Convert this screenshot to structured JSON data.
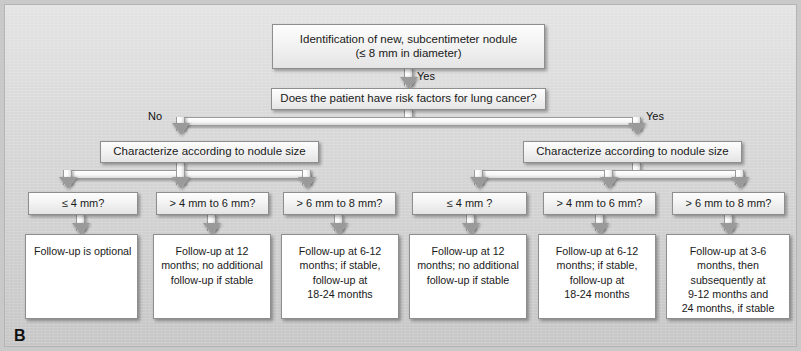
{
  "figure": {
    "panel_label": "B",
    "background_color": "#d5d5d5",
    "box_border_color": "#8e8e8e",
    "leaf_fill_color": "#ffffff"
  },
  "nodes": {
    "root": {
      "line1": "Identification of new, subcentimeter nodule",
      "line2": "(≤ 8 mm in diameter)"
    },
    "decision": {
      "label": "Does the patient have risk factors for lung cancer?"
    },
    "characterize_left": {
      "label": "Characterize according to nodule size"
    },
    "characterize_right": {
      "label": "Characterize according to nodule size"
    }
  },
  "edge_labels": {
    "root_to_decision": "Yes",
    "decision_no": "No",
    "decision_yes": "Yes"
  },
  "size_categories": {
    "left": [
      {
        "label": "≤ 4 mm?"
      },
      {
        "label": "> 4 mm to 6 mm?"
      },
      {
        "label": "> 6 mm to 8 mm?"
      }
    ],
    "right": [
      {
        "label": "≤ 4 mm ?"
      },
      {
        "label": "> 4 mm to 6 mm?"
      },
      {
        "label": "> 6 mm to 8 mm?"
      }
    ]
  },
  "outcomes": {
    "left": [
      {
        "lines": [
          "Follow-up is optional"
        ]
      },
      {
        "lines": [
          "Follow-up at 12",
          "months; no additional",
          "follow-up if stable"
        ]
      },
      {
        "lines": [
          "Follow-up at 6-12",
          "months; if stable,",
          "follow-up at",
          "18-24 months"
        ]
      }
    ],
    "right": [
      {
        "lines": [
          "Follow-up at 12",
          "months; no additional",
          "follow-up if stable"
        ]
      },
      {
        "lines": [
          "Follow-up at 6-12",
          "months; if stable,",
          "follow-up at",
          "18-24 months"
        ]
      },
      {
        "lines": [
          "Follow-up at 3-6",
          "months, then",
          "subsequently at",
          "9-12 months and",
          "24 months, if stable"
        ]
      }
    ]
  }
}
